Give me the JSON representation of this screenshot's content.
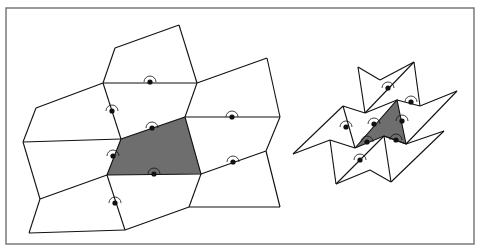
{
  "figure": {
    "colors": {
      "frame": "#7a7a7a",
      "line": "#111111",
      "shaded_tile": "#6e6e6e",
      "background": "#ffffff"
    },
    "frame": {
      "x": 6,
      "y": 8,
      "width": 468,
      "height": 236
    },
    "left_tiling": {
      "shaded_tile": [
        [
          121,
          139
        ],
        [
          185,
          117
        ],
        [
          201,
          174
        ],
        [
          107,
          175
        ]
      ],
      "edges": [
        [
          [
            179,
            25
          ],
          [
            115,
            48
          ]
        ],
        [
          [
            115,
            48
          ],
          [
            103,
            83
          ]
        ],
        [
          [
            179,
            25
          ],
          [
            197,
            83
          ]
        ],
        [
          [
            103,
            83
          ],
          [
            197,
            83
          ]
        ],
        [
          [
            103,
            83
          ],
          [
            36,
            108
          ]
        ],
        [
          [
            36,
            108
          ],
          [
            23,
            142
          ]
        ],
        [
          [
            103,
            83
          ],
          [
            121,
            139
          ]
        ],
        [
          [
            197,
            83
          ],
          [
            185,
            117
          ]
        ],
        [
          [
            197,
            83
          ],
          [
            267,
            58
          ]
        ],
        [
          [
            267,
            58
          ],
          [
            280,
            117
          ]
        ],
        [
          [
            185,
            117
          ],
          [
            280,
            117
          ]
        ],
        [
          [
            23,
            142
          ],
          [
            121,
            139
          ]
        ],
        [
          [
            23,
            142
          ],
          [
            40,
            199
          ]
        ],
        [
          [
            107,
            175
          ],
          [
            40,
            199
          ]
        ],
        [
          [
            40,
            199
          ],
          [
            29,
            233
          ]
        ],
        [
          [
            29,
            233
          ],
          [
            125,
            230
          ]
        ],
        [
          [
            107,
            175
          ],
          [
            125,
            230
          ]
        ],
        [
          [
            125,
            230
          ],
          [
            189,
            207
          ]
        ],
        [
          [
            201,
            174
          ],
          [
            266,
            151
          ]
        ],
        [
          [
            266,
            151
          ],
          [
            280,
            207
          ]
        ],
        [
          [
            201,
            174
          ],
          [
            189,
            207
          ]
        ],
        [
          [
            189,
            207
          ],
          [
            280,
            207
          ]
        ],
        [
          [
            280,
            117
          ],
          [
            266,
            151
          ]
        ]
      ],
      "markers": [
        {
          "x": 150,
          "y": 82
        },
        {
          "x": 112,
          "y": 111
        },
        {
          "x": 152,
          "y": 128
        },
        {
          "x": 113,
          "y": 156
        },
        {
          "x": 154,
          "y": 174
        },
        {
          "x": 115,
          "y": 203
        },
        {
          "x": 232,
          "y": 117
        },
        {
          "x": 233,
          "y": 162
        }
      ]
    },
    "right_tiling": {
      "shaded_tile": [
        [
          355,
          148
        ],
        [
          397,
          100
        ],
        [
          406,
          144
        ],
        [
          384,
          136
        ]
      ],
      "edges": [
        [
          [
            358,
            67
          ],
          [
            380,
            80
          ]
        ],
        [
          [
            380,
            80
          ],
          [
            414,
            62
          ]
        ],
        [
          [
            358,
            67
          ],
          [
            365,
            113
          ]
        ],
        [
          [
            414,
            62
          ],
          [
            365,
            113
          ]
        ],
        [
          [
            414,
            62
          ],
          [
            420,
            106
          ]
        ],
        [
          [
            420,
            106
          ],
          [
            457,
            91
          ]
        ],
        [
          [
            457,
            91
          ],
          [
            406,
            144
          ]
        ],
        [
          [
            343,
            106
          ],
          [
            365,
            113
          ]
        ],
        [
          [
            343,
            106
          ],
          [
            293,
            154
          ]
        ],
        [
          [
            293,
            154
          ],
          [
            330,
            140
          ]
        ],
        [
          [
            330,
            140
          ],
          [
            355,
            148
          ]
        ],
        [
          [
            343,
            106
          ],
          [
            355,
            148
          ]
        ],
        [
          [
            365,
            113
          ],
          [
            397,
            100
          ]
        ],
        [
          [
            397,
            100
          ],
          [
            420,
            106
          ]
        ],
        [
          [
            330,
            140
          ],
          [
            336,
            184
          ]
        ],
        [
          [
            336,
            184
          ],
          [
            384,
            136
          ]
        ],
        [
          [
            384,
            136
          ],
          [
            406,
            144
          ]
        ],
        [
          [
            336,
            184
          ],
          [
            370,
            170
          ]
        ],
        [
          [
            370,
            170
          ],
          [
            391,
            182
          ]
        ],
        [
          [
            391,
            182
          ],
          [
            384,
            136
          ]
        ],
        [
          [
            391,
            182
          ],
          [
            444,
            131
          ]
        ],
        [
          [
            444,
            131
          ],
          [
            406,
            144
          ]
        ]
      ],
      "markers": [
        {
          "x": 388,
          "y": 88
        },
        {
          "x": 411,
          "y": 102
        },
        {
          "x": 346,
          "y": 127
        },
        {
          "x": 374,
          "y": 124
        },
        {
          "x": 402,
          "y": 121
        },
        {
          "x": 367,
          "y": 142
        },
        {
          "x": 396,
          "y": 140
        },
        {
          "x": 360,
          "y": 160
        }
      ]
    }
  }
}
